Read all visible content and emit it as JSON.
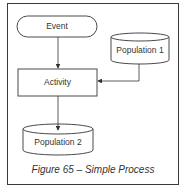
{
  "diagram": {
    "nodes": [
      {
        "id": "event",
        "shape": "terminator",
        "label": "Event"
      },
      {
        "id": "population1",
        "shape": "cylinder",
        "label": "Population 1"
      },
      {
        "id": "activity",
        "shape": "rectangle",
        "label": "Activity"
      },
      {
        "id": "population2",
        "shape": "cylinder",
        "label": "Population 2"
      }
    ],
    "edges": [
      {
        "from": "event",
        "to": "activity"
      },
      {
        "from": "population1",
        "to": "activity"
      },
      {
        "from": "activity",
        "to": "population2"
      }
    ],
    "caption": "Figure 65 – Simple Process",
    "colors": {
      "stroke": "#4a4a4a",
      "text": "#333333",
      "fill": "#ffffff"
    }
  }
}
